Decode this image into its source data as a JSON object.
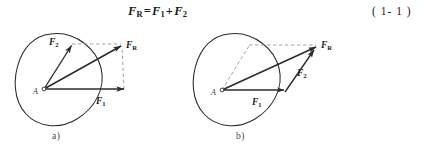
{
  "equation": {
    "lhs": "F",
    "lhs_sub": "R",
    "eq": "=",
    "term1": "F",
    "term1_sub": "1",
    "plus": "+",
    "term2": "F",
    "term2_sub": "2",
    "number": "( 1- 1 )"
  },
  "figures": [
    {
      "id": "a",
      "caption": "a)",
      "method": "parallelogram-rule",
      "point_label": "A",
      "vectors": [
        {
          "name": "F1",
          "label": "F",
          "sub": "1"
        },
        {
          "name": "F2",
          "label": "F",
          "sub": "2"
        },
        {
          "name": "FR",
          "label": "F",
          "sub": "R"
        }
      ]
    },
    {
      "id": "b",
      "caption": "b)",
      "method": "triangle-rule",
      "point_label": "A",
      "vectors": [
        {
          "name": "F1",
          "label": "F",
          "sub": "1"
        },
        {
          "name": "F2",
          "label": "F",
          "sub": "2"
        },
        {
          "name": "FR",
          "label": "F",
          "sub": "R"
        }
      ]
    }
  ],
  "colors": {
    "ink": "#1a1a1a",
    "solid_line": "#2b2b2b",
    "dashed_line": "#8d8d8d",
    "body_outline": "#2b2b2b",
    "background": "#ffffff"
  }
}
